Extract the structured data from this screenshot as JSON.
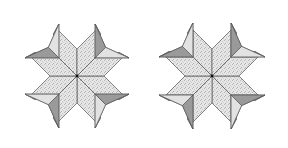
{
  "diagram": {
    "blocks": [
      {
        "id": "left-star",
        "variant": "arrows-hugging-star",
        "center_piece": "textured-diamonds",
        "diamond_count": 8,
        "corner_arrow_count": 4
      },
      {
        "id": "right-star",
        "variant": "arrows-offset-star",
        "center_piece": "textured-diamonds",
        "diamond_count": 8,
        "corner_arrow_count": 4
      }
    ],
    "colors": {
      "background": "#ffffff",
      "outline": "#555555",
      "diamond_fill": "#e6e6e6",
      "diamond_speckle": "#b8b8b8",
      "arrow_dark": "#9a9a9a",
      "arrow_mid": "#c4c4c4",
      "arrow_light": "#e2e2e2",
      "center_dot": "#111111"
    }
  }
}
